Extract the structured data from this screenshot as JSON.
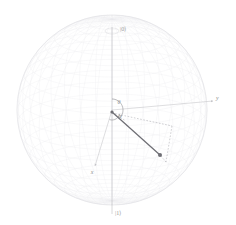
{
  "figure": {
    "type": "bloch-sphere",
    "title": "",
    "background_color": "#ffffff",
    "sphere": {
      "center_x": 112,
      "center_y": 110,
      "radius": 95,
      "mesh_color": "#e9e9ec",
      "outline_color": "#dcdce1",
      "meridian_count": 36,
      "parallel_count": 24
    },
    "axes": [
      {
        "id": "z",
        "label": "",
        "color": "#b9b9bd",
        "x1": 112,
        "y1": 110,
        "x2": 112,
        "y2": 27,
        "arrow": false
      },
      {
        "id": "z-neg",
        "label": "",
        "color": "#b9b9bd",
        "x1": 112,
        "y1": 110,
        "x2": 112,
        "y2": 214,
        "arrow": false
      },
      {
        "id": "y",
        "label": "y",
        "color": "#c2c2c6",
        "x1": 112,
        "y1": 110,
        "x2": 213,
        "y2": 101,
        "arrow": true
      },
      {
        "id": "x",
        "label": "x",
        "color": "#c2c2c6",
        "x1": 112,
        "y1": 110,
        "x2": 95,
        "y2": 166,
        "arrow": true
      }
    ],
    "pole_labels": {
      "north": "|0⟩",
      "south": "|1⟩",
      "north_x": 120,
      "north_y": 31,
      "south_x": 115,
      "south_y": 215
    },
    "axis_labels": {
      "y_label": "y",
      "y_x": 216,
      "y_y": 100,
      "x_label": "x",
      "x_x": 92,
      "x_y": 174
    },
    "angles": [
      {
        "name": "theta",
        "symbol": "θ",
        "label_x": 119,
        "label_y": 104,
        "arc_radius": 11,
        "color": "#7e7e84"
      },
      {
        "name": "phi",
        "symbol": "φ",
        "label_x": 120,
        "label_y": 118,
        "arc_radius": 8,
        "color": "#7e7e84"
      }
    ],
    "state_vector": {
      "label": "",
      "color": "#6f6f75",
      "origin_x": 112,
      "origin_y": 112,
      "tip_x": 160,
      "tip_y": 155,
      "tip_marker": "dot",
      "tip_marker_radius": 2.0
    },
    "projection": {
      "color": "#a8a8ae",
      "dash": "1.6 1.6",
      "segments": [
        {
          "id": "equator-projection",
          "x1": 112,
          "y1": 113,
          "x2": 172,
          "y2": 126
        },
        {
          "id": "projection-to-tip",
          "x1": 172,
          "y1": 126,
          "x2": 166,
          "y2": 162
        },
        {
          "id": "tip-drop",
          "x1": 166,
          "y1": 162,
          "x2": 160,
          "y2": 155
        },
        {
          "id": "origin-to-foot",
          "x1": 112,
          "y1": 113,
          "x2": 126,
          "y2": 121
        }
      ]
    },
    "origin_marker": {
      "x": 112,
      "y": 112,
      "r": 1.6,
      "color": "#6f6f75"
    }
  }
}
